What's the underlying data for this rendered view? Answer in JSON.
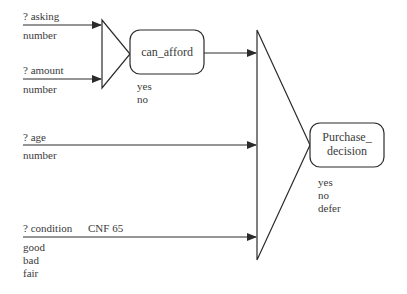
{
  "diagram": {
    "inputs": [
      {
        "name": "? asking",
        "type": "number"
      },
      {
        "name": "? amount",
        "type": "number"
      },
      {
        "name": "? age",
        "type": "number"
      },
      {
        "name": "? condition",
        "cnf": "CNF 65",
        "values": [
          "good",
          "bad",
          "fair"
        ]
      }
    ],
    "nodes": {
      "can_afford": {
        "label": "can_afford",
        "outcomes": [
          "yes",
          "no"
        ]
      },
      "purchase_decision": {
        "label_line1": "Purchase_",
        "label_line2": "decision",
        "outcomes": [
          "yes",
          "no",
          "defer"
        ]
      }
    },
    "colors": {
      "line": "#2b2b2b",
      "text": "#3a3a3a",
      "background": "#ffffff"
    }
  }
}
